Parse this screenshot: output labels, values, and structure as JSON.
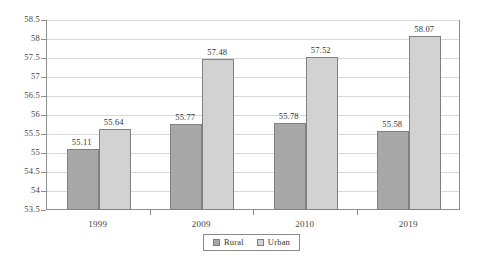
{
  "chart_data": {
    "type": "bar",
    "title": "",
    "subtitle": "",
    "xlabel": "",
    "ylabel": "",
    "categories": [
      "1999",
      "2009",
      "2010",
      "2019"
    ],
    "series": [
      {
        "name": "Rural",
        "color": "#a8a8a8",
        "values": [
          55.11,
          55.77,
          55.78,
          55.58
        ],
        "labels": [
          "55.11",
          "55.77",
          "55.78",
          "55.58"
        ]
      },
      {
        "name": "Urban",
        "color": "#d2d2d2",
        "values": [
          55.64,
          57.48,
          57.52,
          58.07
        ],
        "labels": [
          "55.64",
          "57.48",
          "57.52",
          "58.07"
        ]
      }
    ],
    "ylim": [
      53.5,
      58.5
    ],
    "ystep": 0.5,
    "ytick_labels": [
      "58.5",
      "58",
      "57.5",
      "57",
      "56.5",
      "56",
      "55.5",
      "55",
      "54.5",
      "54",
      "53.5"
    ],
    "ytick_values": [
      58.5,
      58,
      57.5,
      57,
      56.5,
      56,
      55.5,
      55,
      54.5,
      54,
      53.5
    ],
    "grid": true,
    "legend_position": "bottom",
    "legend_entries": [
      "Rural",
      "Urban"
    ],
    "annotations": [],
    "axis_color": "#8e8e8e",
    "grid_color": "#d8d8d8",
    "bar_border_color": "#808080"
  }
}
